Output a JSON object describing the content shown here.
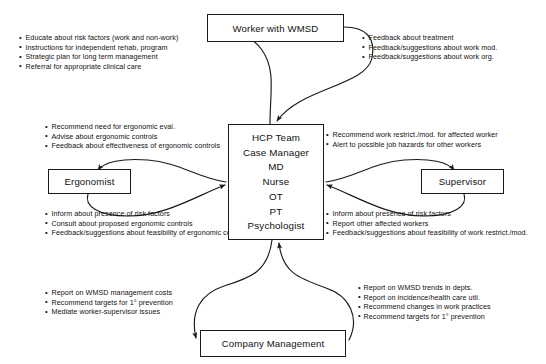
{
  "diagram": {
    "stroke_color": "#1a1a1a",
    "text_color": "#111111",
    "background": "#ffffff"
  },
  "nodes": {
    "worker": {
      "label": "Worker with WMSD"
    },
    "ergonomist": {
      "label": "Ergonomist"
    },
    "supervisor": {
      "label": "Supervisor"
    },
    "company": {
      "label": "Company Management"
    },
    "hcp": {
      "lines": [
        "HCP Team",
        "Case Manager",
        "MD",
        "Nurse",
        "OT",
        "PT",
        "Psychologist"
      ]
    }
  },
  "notes": {
    "worker_outbound": [
      "Educate about risk factors (work and non-work)",
      "Instructions  for independent rehab, program",
      "Strategic plan for long term management",
      "Referral for appropriate clinical care"
    ],
    "worker_inbound": [
      "Feedback about treatment",
      "Feedback/suggestions about work mod.",
      "Feedback/suggestions about work org."
    ],
    "ergonomist_outbound": [
      "Recommend need for ergonomic eval.",
      "Advise about ergonomic controls",
      "Feedback about effectiveness of ergonomic controls"
    ],
    "ergonomist_inbound": [
      "Inform about presence of risk factors",
      "Consult about proposed ergonomic controls",
      "Feedback/suggestions about feasibility of ergonomic controls"
    ],
    "supervisor_outbound": [
      "Recommend work restrict./mod. for affected worker",
      "Alert to possible job hazards for other workers"
    ],
    "supervisor_inbound": [
      "Inform about presence of risk factors",
      "Report other affected workers",
      "Feedback/suggestions about feasibility of work restrict./mod."
    ],
    "company_outbound": [
      "Report on WMSD management costs",
      "Recommend targets for 1° prevention",
      "Mediate worker-supervisor issues"
    ],
    "company_inbound": [
      "Report on WMSD trends in depts.",
      "Report on incidence/health care util.",
      "Recommend changes in work practices",
      "Recommend targets for 1° prevention"
    ]
  }
}
